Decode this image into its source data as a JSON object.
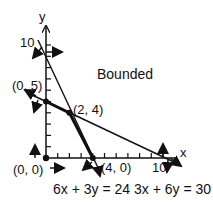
{
  "axes": {
    "x_label": "x",
    "y_label": "y",
    "x_tick_label": "10",
    "y_tick_label": "10"
  },
  "region_label": "Bounded",
  "points": [
    {
      "label": "(0, 5)",
      "x": 0,
      "y": 5
    },
    {
      "label": "(2, 4)",
      "x": 2,
      "y": 4
    },
    {
      "label": "(0, 0)",
      "x": 0,
      "y": 0
    },
    {
      "label": "(4, 0)",
      "x": 4,
      "y": 0
    }
  ],
  "equations": {
    "line1": "6x + 3y = 24",
    "line2": "3x + 6y = 30"
  },
  "colors": {
    "ink": "#111111",
    "background": "#ffffff"
  }
}
